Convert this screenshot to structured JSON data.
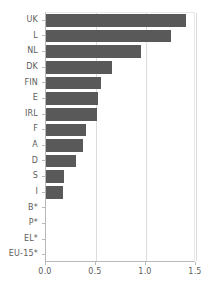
{
  "chart_data": {
    "type": "bar",
    "orientation": "horizontal",
    "title": "",
    "xlabel": "",
    "ylabel": "",
    "xlim": [
      0.0,
      1.5
    ],
    "xticks": [
      "0.0",
      "0.5",
      "1.0",
      "1.5"
    ],
    "xtick_values": [
      0.0,
      0.5,
      1.0,
      1.5
    ],
    "grid": true,
    "legend": "none",
    "bar_color": "#595959",
    "categories": [
      "UK",
      "L",
      "NL",
      "DK",
      "FIN",
      "E",
      "IRL",
      "F",
      "A",
      "D",
      "S",
      "I",
      "B*",
      "P*",
      "EL*",
      "EU-15*"
    ],
    "values": [
      1.4,
      1.25,
      0.95,
      0.66,
      0.55,
      0.52,
      0.51,
      0.4,
      0.37,
      0.3,
      0.18,
      0.17,
      0.0,
      0.0,
      0.0,
      0.0
    ]
  }
}
